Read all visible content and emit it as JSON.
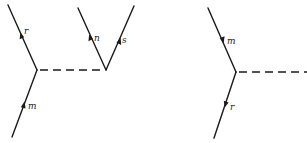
{
  "diagrams": [
    {
      "name": "left-feynman-diagram",
      "vertices": [
        {
          "id": "A",
          "x": 37,
          "y": 70
        },
        {
          "id": "B",
          "x": 106,
          "y": 70
        }
      ],
      "lines": [
        {
          "label": "r",
          "from": [
            37,
            70
          ],
          "to": [
            8,
            5
          ],
          "arrow_dir": "up",
          "arrow_at": [
            22,
            37
          ],
          "label_at": [
            25,
            34
          ]
        },
        {
          "label": "m",
          "from": [
            12,
            137
          ],
          "to": [
            37,
            70
          ],
          "arrow_dir": "up",
          "arrow_at": [
            23,
            106
          ],
          "label_at": [
            28,
            108
          ]
        },
        {
          "label": "n",
          "from": [
            106,
            70
          ],
          "to": [
            78,
            8
          ],
          "arrow_dir": "up",
          "arrow_at": [
            91,
            38
          ],
          "label_at": [
            94,
            41
          ]
        },
        {
          "label": "s",
          "from": [
            106,
            70
          ],
          "to": [
            134,
            6
          ],
          "arrow_dir": "up",
          "arrow_at": [
            119,
            41
          ],
          "label_at": [
            122,
            43
          ]
        }
      ],
      "dashed": {
        "from": [
          37,
          70
        ],
        "to": [
          106,
          70
        ]
      }
    },
    {
      "name": "right-feynman-diagram",
      "vertices": [
        {
          "id": "C",
          "x": 236,
          "y": 72
        }
      ],
      "lines": [
        {
          "label": "m",
          "from": [
            208,
            8
          ],
          "to": [
            236,
            72
          ],
          "arrow_dir": "down",
          "arrow_at": [
            222,
            40
          ],
          "label_at": [
            227,
            44
          ]
        },
        {
          "label": "r",
          "from": [
            236,
            72
          ],
          "to": [
            214,
            138
          ],
          "arrow_dir": "down",
          "arrow_at": [
            226,
            104
          ],
          "label_at": [
            230,
            110
          ]
        }
      ],
      "dashed": {
        "from": [
          236,
          72
        ],
        "to": [
          307,
          72
        ]
      }
    }
  ],
  "labels": {
    "left_r": "r",
    "left_m": "m",
    "left_n": "n",
    "left_s": "s",
    "right_m": "m",
    "right_r": "r"
  }
}
